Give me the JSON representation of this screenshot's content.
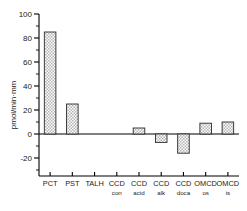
{
  "chart_data": {
    "type": "bar",
    "title": "",
    "subtitle": "",
    "xlabel": "",
    "ylabel": "pmol/min·mm",
    "ylim": [
      -30,
      100
    ],
    "yticks": [
      -20,
      0,
      20,
      40,
      60,
      80,
      100
    ],
    "ytick_labels": [
      "-20",
      "0",
      "20",
      "40",
      "60",
      "80",
      "100"
    ],
    "yminor_ticks": [
      -30,
      -10,
      10,
      30,
      50,
      70,
      90
    ],
    "grid": false,
    "legend": null,
    "categories": [
      "PCT",
      "PST",
      "TALH",
      "CCD con",
      "CCD acid",
      "CCD alk",
      "CCD doca",
      "OMCD os",
      "OMCD is"
    ],
    "category_lines": [
      {
        "top": "PCT",
        "bottom": ""
      },
      {
        "top": "PST",
        "bottom": ""
      },
      {
        "top": "TALH",
        "bottom": ""
      },
      {
        "top": "CCD",
        "bottom": "con"
      },
      {
        "top": "CCD",
        "bottom": "acid"
      },
      {
        "top": "CCD",
        "bottom": "alk"
      },
      {
        "top": "CCD",
        "bottom": "doca"
      },
      {
        "top": "OMCD",
        "bottom": "os"
      },
      {
        "top": "OMCD",
        "bottom": "is"
      }
    ],
    "values": [
      85,
      25,
      0,
      0,
      5,
      -7,
      -16,
      9,
      10
    ],
    "bar_fill": "#c9c9c9",
    "bar_edge": "#2b2b2b",
    "axis_color": "#000000",
    "background": "#ffffff"
  }
}
